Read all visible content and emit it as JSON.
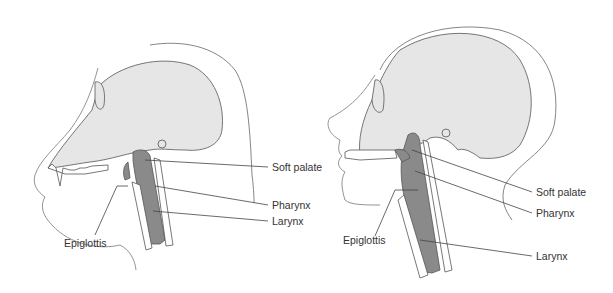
{
  "figures": [
    {
      "name": "chimpanzee",
      "labels": {
        "soft_palate": "Soft palate",
        "pharynx": "Pharynx",
        "larynx": "Larynx",
        "epiglottis": "Epiglottis"
      }
    },
    {
      "name": "human",
      "labels": {
        "soft_palate": "Soft palate",
        "pharynx": "Pharynx",
        "larynx": "Larynx",
        "epiglottis": "Epiglottis"
      }
    }
  ],
  "colors": {
    "skull_fill": "#e6e6e6",
    "airway_fill": "#8a8a8a",
    "outline": "#555555",
    "leader": "#444444"
  }
}
